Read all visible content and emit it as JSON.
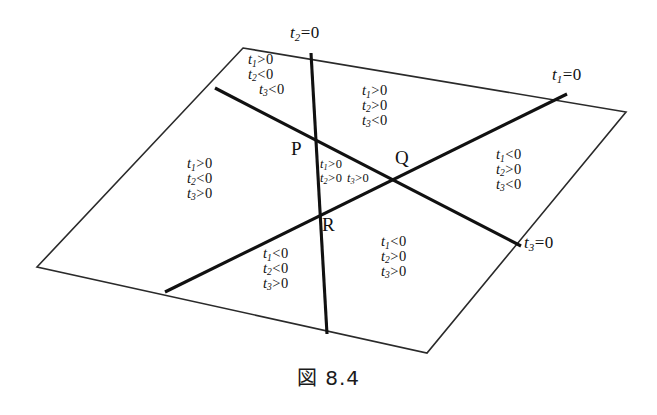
{
  "figure": {
    "caption": "図 8.4",
    "vertices": [
      {
        "name": "P",
        "label": "P"
      },
      {
        "name": "Q",
        "label": "Q"
      },
      {
        "name": "R",
        "label": "R"
      }
    ],
    "line_labels": [
      {
        "name": "t1",
        "var": "t",
        "sub": "1",
        "rel": "=",
        "value": "0",
        "text": "t1=0"
      },
      {
        "name": "t2",
        "var": "t",
        "sub": "2",
        "rel": "=",
        "value": "0",
        "text": "t2=0"
      },
      {
        "name": "t3",
        "var": "t",
        "sub": "3",
        "rel": "=",
        "value": "0",
        "text": "t3=0"
      }
    ],
    "regions": [
      {
        "id": "top-left",
        "conditions": [
          {
            "var": "t",
            "sub": "1",
            "rel": ">",
            "value": "0"
          },
          {
            "var": "t",
            "sub": "2",
            "rel": "<",
            "value": "0"
          },
          {
            "var": "t",
            "sub": "3",
            "rel": "<",
            "value": "0"
          }
        ]
      },
      {
        "id": "top-right",
        "conditions": [
          {
            "var": "t",
            "sub": "1",
            "rel": ">",
            "value": "0"
          },
          {
            "var": "t",
            "sub": "2",
            "rel": ">",
            "value": "0"
          },
          {
            "var": "t",
            "sub": "3",
            "rel": "<",
            "value": "0"
          }
        ]
      },
      {
        "id": "left",
        "conditions": [
          {
            "var": "t",
            "sub": "1",
            "rel": ">",
            "value": "0"
          },
          {
            "var": "t",
            "sub": "2",
            "rel": "<",
            "value": "0"
          },
          {
            "var": "t",
            "sub": "3",
            "rel": ">",
            "value": "0"
          }
        ]
      },
      {
        "id": "right",
        "conditions": [
          {
            "var": "t",
            "sub": "1",
            "rel": "<",
            "value": "0"
          },
          {
            "var": "t",
            "sub": "2",
            "rel": ">",
            "value": "0"
          },
          {
            "var": "t",
            "sub": "3",
            "rel": "<",
            "value": "0"
          }
        ]
      },
      {
        "id": "center-triangle",
        "conditions": [
          {
            "var": "t",
            "sub": "1",
            "rel": ">",
            "value": "0"
          },
          {
            "var": "t",
            "sub": "2",
            "rel": ">",
            "value": "0"
          },
          {
            "var": "t",
            "sub": "3",
            "rel": ">",
            "value": "0"
          }
        ]
      },
      {
        "id": "bottom-left",
        "conditions": [
          {
            "var": "t",
            "sub": "1",
            "rel": "<",
            "value": "0"
          },
          {
            "var": "t",
            "sub": "2",
            "rel": "<",
            "value": "0"
          },
          {
            "var": "t",
            "sub": "3",
            "rel": ">",
            "value": "0"
          }
        ]
      },
      {
        "id": "bottom-right",
        "conditions": [
          {
            "var": "t",
            "sub": "1",
            "rel": "<",
            "value": "0"
          },
          {
            "var": "t",
            "sub": "2",
            "rel": ">",
            "value": "0"
          },
          {
            "var": "t",
            "sub": "3",
            "rel": ">",
            "value": "0"
          }
        ]
      }
    ],
    "colors": {
      "ink": "#111111",
      "background": "#ffffff"
    }
  }
}
